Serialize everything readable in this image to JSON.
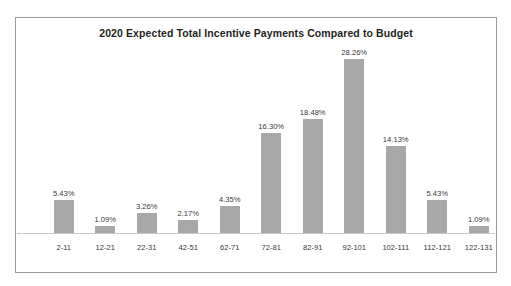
{
  "chart_data": {
    "type": "bar",
    "title": "2020 Expected Total Incentive Payments Compared to Budget",
    "xlabel": "",
    "ylabel": "",
    "grid": false,
    "legend": false,
    "legend_position": "none",
    "axis_visible": true,
    "ylim": [
      0,
      30
    ],
    "value_suffix": "%",
    "bar_color": "#a8a8a8",
    "title_color": "#231f20",
    "label_color": "#3a3a3a",
    "border_color": "#9a9a9a",
    "categories": [
      "2-11",
      "12-21",
      "22-31",
      "42-51",
      "62-71",
      "72-81",
      "82-91",
      "92-101",
      "102-111",
      "112-121",
      "122-131"
    ],
    "values": [
      5.43,
      1.09,
      3.26,
      2.17,
      4.35,
      16.3,
      18.48,
      28.26,
      14.13,
      5.43,
      1.09
    ],
    "value_labels": [
      "5.43%",
      "1.09%",
      "3.26%",
      "2.17%",
      "4.35%",
      "16.30%",
      "18.48%",
      "28.26%",
      "14.13%",
      "5.43%",
      "1.09%"
    ]
  }
}
